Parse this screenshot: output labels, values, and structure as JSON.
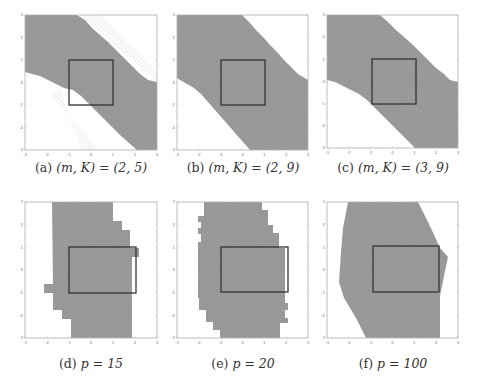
{
  "figure": {
    "colors": {
      "fill": "#9a9a9a",
      "hatch": "#7e7e7e",
      "frame": "#b0b0b0",
      "box": "#333333",
      "light_hatch": "#c8c8c8"
    },
    "x_ticks": [
      "-3",
      "-2",
      "-1",
      "0",
      "1",
      "2",
      "3"
    ],
    "y_ticks": [
      "3",
      "2",
      "1",
      "0",
      "-1",
      "-2",
      "-3"
    ]
  },
  "panels": [
    {
      "id": "a",
      "caption_label": "(a)",
      "caption_expr": "(m, K) = (2, 5)",
      "frame": {
        "x": 25,
        "y": 15,
        "w": 132,
        "h": 135
      },
      "caption_pos": {
        "x": 16,
        "y": 160
      },
      "region": "25,15 77,15 85,20 92,28 100,35 108,42 116,50 124,58 132,66 140,74 148,80 157,82 157,150 137,150 129,143 121,136 113,128 105,120 97,112 89,104 81,96 73,90 64,88 56,84 48,80 40,76 32,74 25,72",
      "light_bands": [
        "80,15 100,15 157,72 157,82",
        "60,88 80,150 100,150 50,95"
      ],
      "box": {
        "x": 69,
        "y": 60,
        "w": 44,
        "h": 45
      }
    },
    {
      "id": "b",
      "caption_label": "(b)",
      "caption_expr": "(m, K) = (2, 9)",
      "frame": {
        "x": 177,
        "y": 15,
        "w": 131,
        "h": 135
      },
      "caption_pos": {
        "x": 168,
        "y": 160
      },
      "region": "177,15 242,15 249,22 256,30 263,37 270,45 277,52 284,60 291,67 298,74 308,80 308,150 250,150 243,142 236,134 229,126 222,118 215,110 208,102 201,94 194,88 187,84 180,80 177,78",
      "light_bands": [],
      "box": {
        "x": 221,
        "y": 60,
        "w": 44,
        "h": 45
      }
    },
    {
      "id": "c",
      "caption_label": "(c)",
      "caption_expr": "(m, K) = (3, 9)",
      "frame": {
        "x": 327,
        "y": 15,
        "w": 131,
        "h": 133
      },
      "caption_pos": {
        "x": 318,
        "y": 160
      },
      "region": "327,15 380,15 388,22 396,30 404,37 412,44 420,52 428,60 436,68 444,74 450,80 458,82 458,148 415,148 407,140 399,132 391,124 383,116 375,108 367,100 359,94 351,90 343,86 335,82 327,80",
      "light_bands": [],
      "box": {
        "x": 372,
        "y": 59,
        "w": 44,
        "h": 45
      }
    },
    {
      "id": "d",
      "caption_label": "(d)",
      "caption_expr": "p = 15",
      "frame": {
        "x": 25,
        "y": 202,
        "w": 132,
        "h": 136
      },
      "caption_pos": {
        "x": 16,
        "y": 356
      },
      "region": "52,202 113,202 113,221 122,221 122,230 130,230 130,248 139,248 139,257 132,257 132,338 71,338 71,319 62,319 62,310 53,310 53,293 44,293 44,284 53,284",
      "light_bands": [],
      "box": {
        "x": 69,
        "y": 247,
        "w": 67,
        "h": 46
      }
    },
    {
      "id": "e",
      "caption_label": "(e)",
      "caption_expr": "p = 20",
      "frame": {
        "x": 177,
        "y": 202,
        "w": 131,
        "h": 136
      },
      "caption_pos": {
        "x": 168,
        "y": 356
      },
      "region": "204,202 262,202 262,210 268,210 268,225 273,225 273,233 279,233 279,248 285,248 285,303 288,303 288,310 285,310 285,318 288,318 288,323 280,323 280,338 220,338 220,330 213,330 213,322 206,322 206,310 199,310 199,298 198,298 198,242 201,242 201,234 198,234 198,228 201,228 201,222 198,222 198,216 204,216",
      "light_bands": [],
      "box": {
        "x": 221,
        "y": 247,
        "w": 67,
        "h": 45
      }
    },
    {
      "id": "f",
      "caption_label": "(f)",
      "caption_expr": "p = 100",
      "frame": {
        "x": 327,
        "y": 202,
        "w": 131,
        "h": 136
      },
      "caption_pos": {
        "x": 318,
        "y": 356
      },
      "region": "348,202 418,202 430,226 440,248 448,257 444,276 440,296 440,338 366,338 356,318 344,298 339,282 341,252 343,228",
      "light_bands": [],
      "box": {
        "x": 373,
        "y": 246,
        "w": 66,
        "h": 46
      }
    }
  ]
}
